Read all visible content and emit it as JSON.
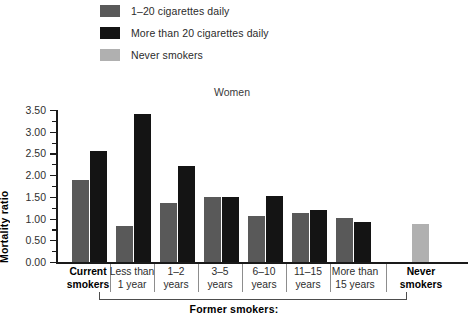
{
  "legend": {
    "items": [
      {
        "label": "1–20 cigarettes daily",
        "color": "#595959",
        "swatch_name": "legend-swatch-light-smoker"
      },
      {
        "label": "More than 20 cigarettes daily",
        "color": "#141414",
        "swatch_name": "legend-swatch-heavy-smoker"
      },
      {
        "label": "Never smokers",
        "color": "#b0b0b0",
        "swatch_name": "legend-swatch-never-smoker"
      }
    ]
  },
  "axis": {
    "y_title": "Mortality ratio",
    "y_ticks": [
      "0.00",
      "0.50",
      "1.00",
      "1.50",
      "2.00",
      "2.50",
      "3.00",
      "3.50"
    ]
  },
  "bracket": {
    "label": "Former smokers:"
  },
  "chart_data": {
    "type": "bar",
    "title": "Women",
    "xlabel": "",
    "ylabel": "Mortality ratio",
    "ylim": [
      0.0,
      3.5
    ],
    "ytick_step": 0.5,
    "yminor_step": 0.25,
    "grid": false,
    "legend_position": "top-left",
    "categories": [
      "Current smokers",
      "Less than 1 year",
      "1–2 years",
      "3–5 years",
      "6–10 years",
      "11–15 years",
      "More than 15 years",
      "Never smokers"
    ],
    "category_lines": [
      [
        "Current",
        "smokers"
      ],
      [
        "Less than",
        "1 year"
      ],
      [
        "1–2",
        "years"
      ],
      [
        "3–5",
        "years"
      ],
      [
        "6–10",
        "years"
      ],
      [
        "11–15",
        "years"
      ],
      [
        "More than",
        "15 years"
      ],
      [
        "Never",
        "smokers"
      ]
    ],
    "category_bold": [
      true,
      false,
      false,
      false,
      false,
      false,
      false,
      true
    ],
    "series": [
      {
        "name": "1–20 cigarettes daily",
        "color": "#595959",
        "values": [
          1.9,
          0.82,
          1.36,
          1.5,
          1.05,
          1.13,
          1.01,
          null
        ]
      },
      {
        "name": "More than 20 cigarettes daily",
        "color": "#141414",
        "values": [
          2.55,
          3.4,
          2.22,
          1.5,
          1.52,
          1.2,
          0.93,
          null
        ]
      },
      {
        "name": "Never smokers",
        "color": "#b0b0b0",
        "values": [
          null,
          null,
          null,
          null,
          null,
          null,
          null,
          0.88
        ]
      }
    ]
  }
}
